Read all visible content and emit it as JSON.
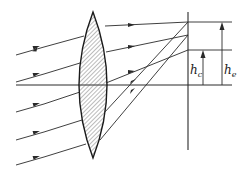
{
  "diagram": {
    "type": "optics-ray-diagram",
    "colors": {
      "line": "#2a2a2a",
      "hatch": "#555555",
      "background": "#ffffff"
    },
    "labels": {
      "hc": {
        "main": "h",
        "sub": "c"
      },
      "he": {
        "main": "h",
        "sub": "e"
      }
    },
    "elements": {
      "lens": "biconvex lens (hatched)",
      "optical_axis": "horizontal axis",
      "image_plane": "vertical line at focal plane",
      "rays_in": 5,
      "arrow_hc": "height to lower image point",
      "arrow_he": "height to upper image point"
    }
  }
}
